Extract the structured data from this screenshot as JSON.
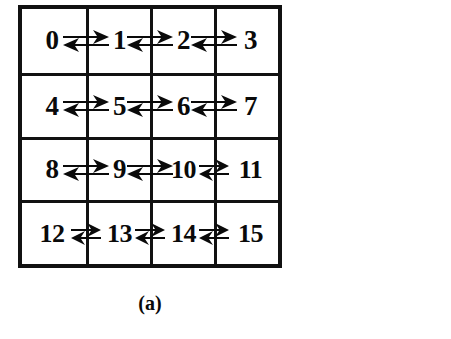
{
  "figure": {
    "caption": "(a)",
    "kind": "4x4-mesh-topology-diagram",
    "grid": {
      "rows": 4,
      "cols": 4,
      "border_color": "#111111",
      "background": "#ffffff",
      "node_color": "#0a0a0a",
      "nodes": [
        [
          {
            "label": "0"
          },
          {
            "label": "1"
          },
          {
            "label": "2"
          },
          {
            "label": "3"
          }
        ],
        [
          {
            "label": "4"
          },
          {
            "label": "5"
          },
          {
            "label": "6"
          },
          {
            "label": "7"
          }
        ],
        [
          {
            "label": "8"
          },
          {
            "label": "9"
          },
          {
            "label": "10"
          },
          {
            "label": "11"
          }
        ],
        [
          {
            "label": "12"
          },
          {
            "label": "13"
          },
          {
            "label": "14"
          },
          {
            "label": "15"
          }
        ]
      ],
      "links": [
        {
          "from": "0",
          "to": "1",
          "direction": "bidirectional",
          "style": "wide"
        },
        {
          "from": "1",
          "to": "2",
          "direction": "bidirectional",
          "style": "wide"
        },
        {
          "from": "2",
          "to": "3",
          "direction": "bidirectional",
          "style": "wide"
        },
        {
          "from": "4",
          "to": "5",
          "direction": "bidirectional",
          "style": "wide"
        },
        {
          "from": "5",
          "to": "6",
          "direction": "bidirectional",
          "style": "wide"
        },
        {
          "from": "6",
          "to": "7",
          "direction": "bidirectional",
          "style": "wide"
        },
        {
          "from": "8",
          "to": "9",
          "direction": "bidirectional",
          "style": "wide"
        },
        {
          "from": "9",
          "to": "10",
          "direction": "bidirectional",
          "style": "wide"
        },
        {
          "from": "10",
          "to": "11",
          "direction": "bidirectional",
          "style": "narrow"
        },
        {
          "from": "12",
          "to": "13",
          "direction": "bidirectional",
          "style": "narrow"
        },
        {
          "from": "13",
          "to": "14",
          "direction": "bidirectional",
          "style": "narrow"
        },
        {
          "from": "14",
          "to": "15",
          "direction": "bidirectional",
          "style": "narrow"
        }
      ]
    }
  }
}
